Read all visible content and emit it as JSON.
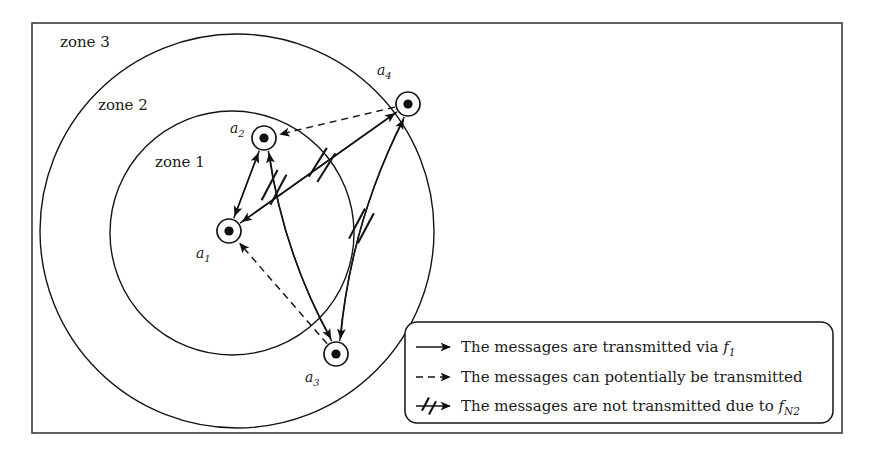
{
  "figure": {
    "zones": [
      {
        "id": "zone1",
        "label": "zone 1",
        "label_x": 155,
        "label_y": 167,
        "cx": 232,
        "cy": 233,
        "r": 122
      },
      {
        "id": "zone2",
        "label": "zone 2",
        "label_x": 98,
        "label_y": 110,
        "cx": 237,
        "cy": 231,
        "r": 197
      },
      {
        "id": "zone3",
        "label": "zone 3",
        "label_x": 60,
        "label_y": 47,
        "cx": 0,
        "cy": 0,
        "r": 0
      }
    ],
    "nodes": [
      {
        "id": "a1",
        "base": "a",
        "sub": "1",
        "cx": 229,
        "cy": 231,
        "r": 12,
        "core_r": 4.6,
        "label_x": 196,
        "label_y": 258
      },
      {
        "id": "a2",
        "base": "a",
        "sub": "2",
        "cx": 264,
        "cy": 138,
        "r": 12,
        "core_r": 4.6,
        "label_x": 230,
        "label_y": 133
      },
      {
        "id": "a3",
        "base": "a",
        "sub": "3",
        "cx": 336,
        "cy": 354,
        "r": 12,
        "core_r": 4.6,
        "label_x": 305,
        "label_y": 382
      },
      {
        "id": "a4",
        "base": "a",
        "sub": "4",
        "cx": 408,
        "cy": 104,
        "r": 12,
        "core_r": 4.6,
        "label_x": 377,
        "label_y": 75
      }
    ],
    "edge_kinds": {
      "solid": "transmitted",
      "dashed": "potential",
      "blocked": "not-transmitted"
    },
    "edges": [
      {
        "from": "a1",
        "to": "a2",
        "kind": "solid",
        "blocked": false
      },
      {
        "from": "a2",
        "to": "a1",
        "kind": "solid",
        "blocked": false
      },
      {
        "from": "a3",
        "to": "a2",
        "kind": "solid",
        "blocked": false
      },
      {
        "from": "a2",
        "to": "a3",
        "kind": "blocked",
        "blocked": true
      },
      {
        "from": "a4",
        "to": "a1",
        "kind": "solid",
        "blocked": false
      },
      {
        "from": "a1",
        "to": "a4",
        "kind": "blocked",
        "blocked": true
      },
      {
        "from": "a3",
        "to": "a4",
        "kind": "solid",
        "blocked": false
      },
      {
        "from": "a4",
        "to": "a3",
        "kind": "blocked",
        "blocked": true
      },
      {
        "from": "a4",
        "to": "a2",
        "kind": "dashed",
        "blocked": false
      },
      {
        "from": "a3",
        "to": "a1",
        "kind": "dashed",
        "blocked": false
      }
    ]
  },
  "legend": {
    "box": {
      "x": 405,
      "y": 322,
      "w": 428,
      "h": 101,
      "radius": 12
    },
    "items": [
      {
        "symbol": "solid-arrow",
        "text_pre": "The messages are transmitted via ",
        "italic": "f",
        "sub": "1",
        "text_post": ""
      },
      {
        "symbol": "dashed-arrow",
        "text_pre": "The messages can potentially be transmitted",
        "italic": "",
        "sub": "",
        "text_post": ""
      },
      {
        "symbol": "blocked-arrow",
        "text_pre": "The messages are not transmitted due to ",
        "italic": "f",
        "sub": "N2",
        "text_post": ""
      }
    ]
  },
  "frame": {
    "x": 32,
    "y": 23,
    "w": 810,
    "h": 410
  },
  "colors": {
    "stroke": "#141414",
    "frame": "#3a3a3a",
    "background": "#ffffff",
    "node_fill": "#101010"
  }
}
